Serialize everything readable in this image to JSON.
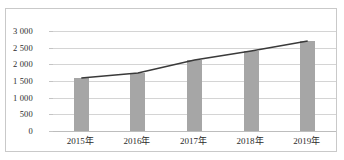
{
  "chart_data": {
    "type": "bar",
    "title": "",
    "subtitle": "",
    "xlabel": "",
    "ylabel": "",
    "categories": [
      "2015年",
      "2016年",
      "2017年",
      "2018年",
      "2019年"
    ],
    "series": [
      {
        "name": "bars",
        "type": "bar",
        "values": [
          1590,
          1740,
          2130,
          2400,
          2700
        ],
        "color": "#a6a6a6"
      },
      {
        "name": "trend",
        "type": "line",
        "values": [
          1590,
          1740,
          2130,
          2400,
          2700
        ],
        "color": "#3a3a3a"
      }
    ],
    "ylim": [
      0,
      3000
    ],
    "ytick_values": [
      0,
      500,
      1000,
      1500,
      2000,
      2500,
      3000
    ],
    "ytick_labels": [
      "0",
      "500",
      "1 000",
      "1 500",
      "2 000",
      "2 500",
      "3 000"
    ],
    "grid": true,
    "legend": false,
    "legend_position": "none"
  },
  "axes": {
    "y": {
      "ticks": [
        {
          "label": "3 000",
          "value": 3000
        },
        {
          "label": "2 500",
          "value": 2500
        },
        {
          "label": "2 000",
          "value": 2000
        },
        {
          "label": "1 500",
          "value": 1500
        },
        {
          "label": "1 000",
          "value": 1000
        },
        {
          "label": "500",
          "value": 500
        },
        {
          "label": "0",
          "value": 0
        }
      ]
    },
    "x": {
      "ticks": [
        {
          "label": "2015年"
        },
        {
          "label": "2016年"
        },
        {
          "label": "2017年"
        },
        {
          "label": "2018年"
        },
        {
          "label": "2019年"
        }
      ]
    }
  },
  "style": {
    "bar_color": "#a6a6a6",
    "line_color": "#3a3a3a",
    "grid_color": "#d4d4d4",
    "frame_color": "#c9c9c9",
    "text_color": "#2b2b2b",
    "background": "#ffffff"
  }
}
